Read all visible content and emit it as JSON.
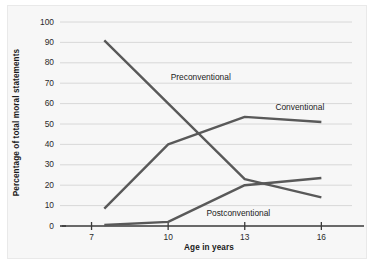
{
  "chart_data": {
    "type": "line",
    "title": "",
    "xlabel": "Age in years",
    "ylabel": "Percentage of total moral statements",
    "xlim": [
      6,
      17.2
    ],
    "ylim": [
      0,
      100
    ],
    "xticks": [
      7,
      10,
      13,
      16
    ],
    "xtick_labels": [
      "7",
      "10",
      "13",
      "16"
    ],
    "yticks": [
      0,
      10,
      20,
      30,
      40,
      50,
      60,
      70,
      80,
      90,
      100
    ],
    "ytick_labels": [
      "0",
      "10",
      "20",
      "30",
      "40",
      "50",
      "60",
      "70",
      "80",
      "90",
      "100"
    ],
    "grid": true,
    "grid_axis": "y",
    "legend": "inline-annotations",
    "line_color": "#595959",
    "grid_color": "#d8d8d8",
    "axis_color": "#3a3a3a",
    "background": "#f7f7f7",
    "series": [
      {
        "name": "Preconventional",
        "label": "Preconventional",
        "label_x": 10.1,
        "label_y": 73,
        "x": [
          7.5,
          13,
          16
        ],
        "values": [
          91,
          23,
          14
        ]
      },
      {
        "name": "Conventional",
        "label": "Conventional",
        "label_x": 14.2,
        "label_y": 58,
        "x": [
          7.5,
          10,
          13,
          16
        ],
        "values": [
          8.5,
          40,
          53.5,
          51
        ]
      },
      {
        "name": "Postconventional",
        "label": "Postconventional",
        "label_x": 11.5,
        "label_y": 6,
        "x": [
          7.5,
          10,
          13,
          16
        ],
        "values": [
          0.5,
          2,
          20,
          23.5
        ]
      }
    ]
  }
}
